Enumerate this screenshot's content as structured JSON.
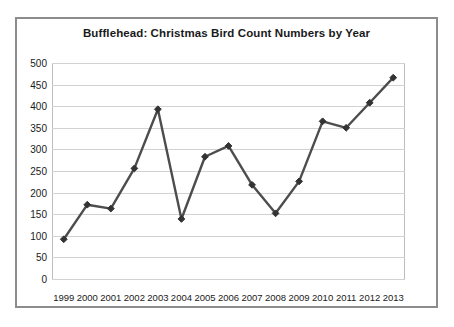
{
  "chart_data": {
    "type": "line",
    "title": "Bufflehead: Christmas Bird Count Numbers by Year",
    "xlabel": "",
    "ylabel": "",
    "categories": [
      "1999",
      "2000",
      "2001",
      "2002",
      "2003",
      "2004",
      "2005",
      "2006",
      "2007",
      "2008",
      "2009",
      "2010",
      "2011",
      "2012",
      "2013"
    ],
    "values": [
      92,
      172,
      163,
      256,
      393,
      139,
      283,
      308,
      218,
      152,
      226,
      365,
      350,
      408,
      466
    ],
    "series": [
      {
        "name": "Bufflehead count",
        "values": [
          92,
          172,
          163,
          256,
          393,
          139,
          283,
          308,
          218,
          152,
          226,
          365,
          350,
          408,
          466
        ]
      }
    ],
    "ylim": [
      0,
      500
    ],
    "ytick_labels": [
      "500",
      "450",
      "400",
      "350",
      "300",
      "250",
      "200",
      "150",
      "100",
      "50",
      "0"
    ],
    "ytick_values": [
      500,
      450,
      400,
      350,
      300,
      250,
      200,
      150,
      100,
      50,
      0
    ],
    "grid": true,
    "legend": "none",
    "marker": "diamond",
    "colors": {
      "line": "#4d4d4d",
      "marker": "#333333",
      "gridline": "#d2d2d2",
      "frame": "#8c8c8c",
      "text": "#1a1a1a",
      "background": "#ffffff"
    }
  }
}
